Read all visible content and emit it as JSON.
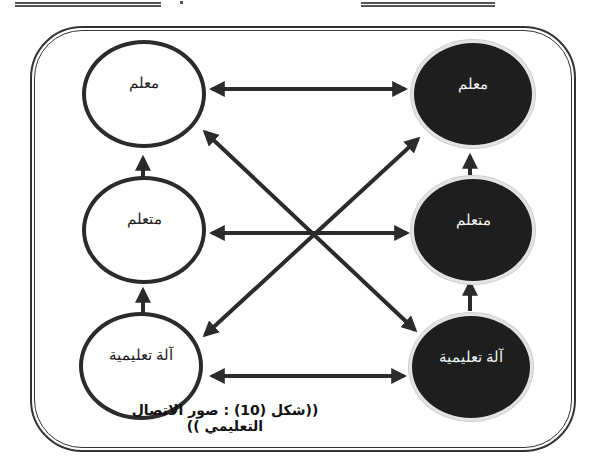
{
  "figure": {
    "caption": "((شكل (10) : صور الاتصال التعليمي ))",
    "left_column": {
      "style": "outline",
      "nodes": [
        {
          "label": "معلم"
        },
        {
          "label": "متعلم"
        },
        {
          "label": "آلة تعليمية"
        }
      ]
    },
    "right_column": {
      "style": "filled",
      "nodes": [
        {
          "label": "معلم"
        },
        {
          "label": "متعلم"
        },
        {
          "label": "آلة تعليمية"
        }
      ]
    },
    "connections": [
      {
        "from": "left.آلة تعليمية",
        "to": "left.متعلم",
        "type": "one-way-up"
      },
      {
        "from": "left.متعلم",
        "to": "left.معلم",
        "type": "one-way-up"
      },
      {
        "from": "right.آلة تعليمية",
        "to": "right.متعلم",
        "type": "one-way-up"
      },
      {
        "from": "right.متعلم",
        "to": "right.معلم",
        "type": "one-way-up"
      },
      {
        "from": "left.معلم",
        "to": "right.معلم",
        "type": "two-way"
      },
      {
        "from": "left.متعلم",
        "to": "right.متعلم",
        "type": "two-way"
      },
      {
        "from": "left.آلة تعليمية",
        "to": "right.آلة تعليمية",
        "type": "two-way"
      },
      {
        "from": "left.معلم",
        "to": "right.آلة تعليمية",
        "type": "two-way-diagonal"
      },
      {
        "from": "left.آلة تعليمية",
        "to": "right.معلم",
        "type": "two-way-diagonal"
      }
    ],
    "colors": {
      "stroke": "#2b2b2b",
      "filled_node": "#1e1e1e",
      "outline_node_fill": "#ffffff"
    }
  }
}
